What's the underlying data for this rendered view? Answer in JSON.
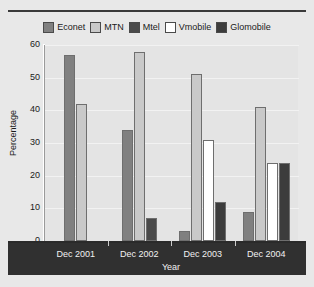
{
  "chart_data": {
    "type": "bar",
    "title": "",
    "xlabel": "Year",
    "ylabel": "Percentage",
    "categories": [
      "Dec 2001",
      "Dec 2002",
      "Dec 2003",
      "Dec 2004"
    ],
    "ylim": [
      0,
      60
    ],
    "y_ticks": [
      0,
      10,
      20,
      30,
      40,
      50,
      60
    ],
    "grid": true,
    "legend_position": "top",
    "series": [
      {
        "name": "Econet",
        "color": "#808080",
        "values": [
          57,
          34,
          3,
          9
        ]
      },
      {
        "name": "MTN",
        "color": "#c9c9c9",
        "values": [
          42,
          58,
          51,
          41
        ]
      },
      {
        "name": "Mtel",
        "color": "#4a4a4a",
        "values": [
          0,
          7,
          0,
          0
        ]
      },
      {
        "name": "Vmobile",
        "color": "#ffffff",
        "values": [
          0,
          0,
          31,
          24
        ]
      },
      {
        "name": "Glomobile",
        "color": "#3c3c3c",
        "values": [
          0,
          0,
          12,
          24
        ]
      }
    ]
  },
  "legend": {
    "items": [
      {
        "label": "Econet"
      },
      {
        "label": "MTN"
      },
      {
        "label": "Mtel"
      },
      {
        "label": "Vmobile"
      },
      {
        "label": "Glomobile"
      }
    ]
  },
  "axes": {
    "y_title": "Percentage",
    "x_title": "Year",
    "y_tick_labels": [
      "60",
      "50",
      "40",
      "30",
      "20",
      "10",
      "0"
    ],
    "x_tick_labels": [
      "Dec 2001",
      "Dec 2002",
      "Dec 2003",
      "Dec 2004"
    ]
  }
}
